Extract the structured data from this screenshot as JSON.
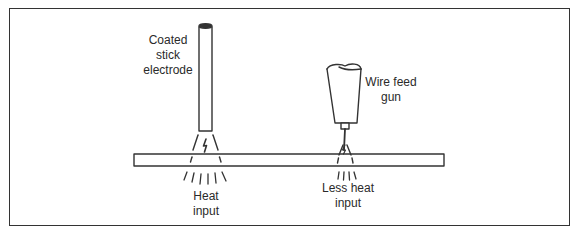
{
  "diagram": {
    "title": "",
    "labels": {
      "stick_electrode": [
        "Coated",
        "stick",
        "electrode"
      ],
      "wire_feed_gun": [
        "Wire feed",
        "gun"
      ],
      "heat_input": [
        "Heat",
        "input"
      ],
      "less_heat_input": [
        "Less heat",
        "input"
      ]
    },
    "components": [
      {
        "id": "coated-stick-electrode",
        "type": "electrode"
      },
      {
        "id": "wire-feed-gun",
        "type": "welding-gun"
      },
      {
        "id": "workpiece-plate",
        "type": "plate"
      },
      {
        "id": "arc-stick",
        "type": "arc",
        "icon": "lightning-bolt-icon"
      },
      {
        "id": "arc-wire",
        "type": "arc",
        "icon": "lightning-bolt-icon"
      }
    ],
    "relationships": [
      {
        "from": "coated-stick-electrode",
        "to": "heat_input",
        "relation": "produces"
      },
      {
        "from": "wire-feed-gun",
        "to": "less_heat_input",
        "relation": "produces"
      }
    ],
    "colors": {
      "stroke": "#333333",
      "text": "#2a2a2a",
      "background": "#ffffff"
    }
  }
}
